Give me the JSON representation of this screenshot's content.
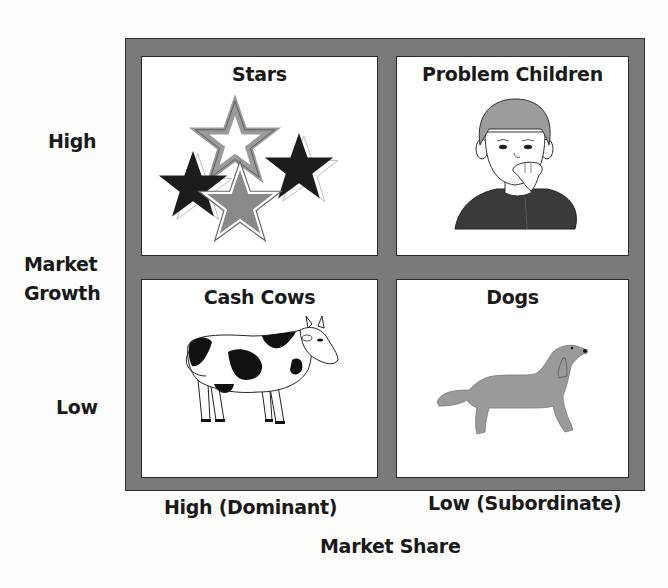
{
  "diagram": {
    "type": "bcg-growth-share-matrix",
    "y_axis": {
      "title_line1": "Market",
      "title_line2": "Growth",
      "high_label": "High",
      "low_label": "Low"
    },
    "x_axis": {
      "title": "Market Share",
      "high_label": "High (Dominant)",
      "low_label": "Low (Subordinate)"
    },
    "quadrants": [
      {
        "position": "top-left",
        "title": "Stars",
        "illustration": "stars-icon"
      },
      {
        "position": "top-right",
        "title": "Problem Children",
        "illustration": "child-icon"
      },
      {
        "position": "bottom-left",
        "title": "Cash Cows",
        "illustration": "cow-icon"
      },
      {
        "position": "bottom-right",
        "title": "Dogs",
        "illustration": "dog-icon"
      }
    ],
    "colors": {
      "frame": "#7a7a7a",
      "panel": "#ffffff",
      "star_dark": "#1c1c1c",
      "star_gray": "#8a8a8a",
      "dog": "#9a9a9a",
      "child_shirt": "#3a3a3a",
      "child_hair": "#9c9c9c"
    }
  }
}
